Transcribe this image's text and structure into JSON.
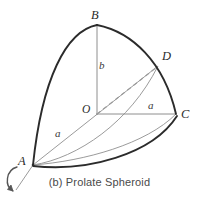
{
  "figure": {
    "caption": "(b) Prolate Spheroid",
    "colors": {
      "outline": "#2b2b2b",
      "construction": "#999999",
      "dashed": "#9a9a9a",
      "axis_arrow": "#555555",
      "text": "#2b2b2b",
      "background": "#ffffff"
    },
    "vertices": [
      {
        "key": "B",
        "label": "B",
        "x": 97,
        "y": 25,
        "label_x": 91,
        "label_y": 9
      },
      {
        "key": "D",
        "label": "D",
        "x": 158,
        "y": 66,
        "label_x": 162,
        "label_y": 50
      },
      {
        "key": "C",
        "label": "C",
        "x": 176,
        "y": 114,
        "label_x": 181,
        "label_y": 108
      },
      {
        "key": "O",
        "label": "O",
        "x": 97,
        "y": 114,
        "label_x": 82,
        "label_y": 104
      },
      {
        "key": "A",
        "label": "A",
        "x": 33,
        "y": 165,
        "label_x": 18,
        "label_y": 155
      }
    ],
    "dimensions": [
      {
        "key": "b-semi-minor-vertical",
        "label": "b",
        "label_x": 99,
        "label_y": 60,
        "from": "O",
        "to": "B"
      },
      {
        "key": "a-semi-major-left",
        "label": "a",
        "label_x": 55,
        "label_y": 128,
        "from": "A",
        "to": "D"
      },
      {
        "key": "a-semi-minor-right",
        "label": "a",
        "label_x": 148,
        "label_y": 100,
        "from": "O",
        "to": "C"
      }
    ],
    "axis_of_revolution": {
      "name": "rotation-axis-arrow",
      "description": "curved arrow about axis through A"
    }
  }
}
